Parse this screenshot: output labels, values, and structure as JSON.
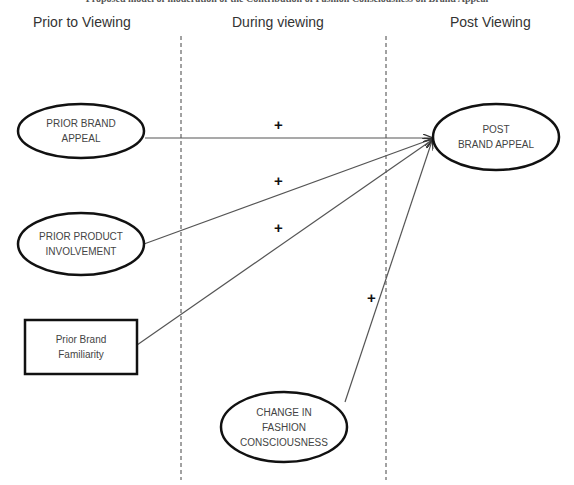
{
  "title": "Proposed model of moderation of the Contribution of Fashion Consciousness on Brand Appeal",
  "phases": {
    "prior": "Prior to Viewing",
    "during": "During viewing",
    "post": "Post Viewing"
  },
  "nodes": {
    "prior_brand_appeal": {
      "line1": "PRIOR BRAND",
      "line2": "APPEAL",
      "shape": "ellipse"
    },
    "prior_product_involvement": {
      "line1": "PRIOR PRODUCT",
      "line2": "INVOLVEMENT",
      "shape": "ellipse"
    },
    "prior_brand_familiarity": {
      "line1": "Prior Brand",
      "line2": "Familiarity",
      "shape": "rectangle"
    },
    "post_brand_appeal": {
      "line1": "POST",
      "line2": "BRAND APPEAL",
      "shape": "ellipse"
    },
    "change_fashion_consciousness": {
      "line1": "CHANGE IN",
      "line2": "FASHION",
      "line3": "CONSCIOUSNESS",
      "shape": "ellipse"
    }
  },
  "edges": [
    {
      "from": "prior_brand_appeal",
      "to": "post_brand_appeal",
      "sign": "+"
    },
    {
      "from": "prior_product_involvement",
      "to": "post_brand_appeal",
      "sign": "+"
    },
    {
      "from": "prior_brand_familiarity",
      "to": "post_brand_appeal",
      "sign": "+"
    },
    {
      "from": "change_fashion_consciousness",
      "to": "post_brand_appeal",
      "sign": "+"
    }
  ],
  "colors": {
    "stroke": "#111111",
    "line": "#555555",
    "text": "#444444",
    "divider": "#444444"
  }
}
